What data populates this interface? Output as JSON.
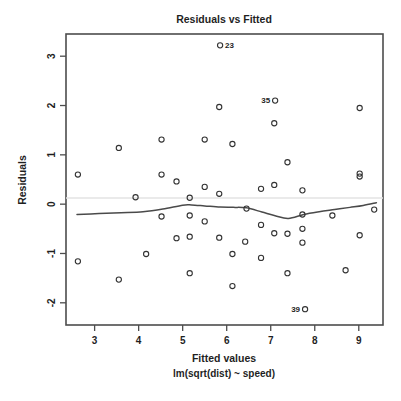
{
  "chart_data": {
    "type": "scatter",
    "title": "Residuals vs Fitted",
    "xlabel": "Fitted values",
    "sublabel": "lm(sqrt(dist) ~ speed)",
    "ylabel": "Residuals",
    "xlim": [
      2.35,
      9.55
    ],
    "ylim": [
      -2.45,
      3.45
    ],
    "xticks": [
      3,
      4,
      5,
      6,
      7,
      8,
      9
    ],
    "xticklabels": [
      "3",
      "4",
      "5",
      "6",
      "7",
      "8",
      "9"
    ],
    "yticks": [
      -2,
      -1,
      0,
      1,
      2,
      3
    ],
    "yticklabels": [
      "-2",
      "-1",
      "0",
      "1",
      "2",
      "3"
    ],
    "grid": false,
    "legend": null,
    "reference_line": {
      "y": 0,
      "color": "#e3e3e3"
    },
    "smoother": {
      "name": "lowess",
      "color": "#4a4a4a",
      "x": [
        2.6,
        3.1,
        3.6,
        4.1,
        4.55,
        5.0,
        5.2,
        5.5,
        5.85,
        6.15,
        6.45,
        6.8,
        7.1,
        7.4,
        7.75,
        8.1,
        8.45,
        8.8,
        9.1,
        9.4
      ],
      "y": [
        -0.21,
        -0.19,
        -0.175,
        -0.155,
        -0.1,
        -0.02,
        -0.015,
        -0.035,
        -0.06,
        -0.065,
        -0.075,
        -0.16,
        -0.235,
        -0.29,
        -0.21,
        -0.155,
        -0.11,
        -0.065,
        -0.025,
        0.03
      ]
    },
    "points": [
      {
        "x": 2.62,
        "y": 0.6
      },
      {
        "x": 2.62,
        "y": -1.16
      },
      {
        "x": 3.55,
        "y": 1.14
      },
      {
        "x": 3.55,
        "y": -1.53
      },
      {
        "x": 3.93,
        "y": 0.14
      },
      {
        "x": 4.17,
        "y": -1.01
      },
      {
        "x": 4.52,
        "y": 1.31
      },
      {
        "x": 4.52,
        "y": 0.6
      },
      {
        "x": 4.52,
        "y": -0.25
      },
      {
        "x": 4.86,
        "y": 0.46
      },
      {
        "x": 4.86,
        "y": -0.69
      },
      {
        "x": 5.16,
        "y": 0.13
      },
      {
        "x": 5.16,
        "y": -0.23
      },
      {
        "x": 5.16,
        "y": -0.66
      },
      {
        "x": 5.16,
        "y": -1.4
      },
      {
        "x": 5.5,
        "y": 1.31
      },
      {
        "x": 5.5,
        "y": 0.35
      },
      {
        "x": 5.5,
        "y": -0.35
      },
      {
        "x": 5.83,
        "y": 1.97
      },
      {
        "x": 5.83,
        "y": 0.21
      },
      {
        "x": 5.83,
        "y": -0.68
      },
      {
        "x": 5.85,
        "y": 3.22,
        "label": "23",
        "label_side": "right"
      },
      {
        "x": 6.13,
        "y": 1.22
      },
      {
        "x": 6.13,
        "y": -1.01
      },
      {
        "x": 6.13,
        "y": -1.66
      },
      {
        "x": 6.42,
        "y": -0.76
      },
      {
        "x": 6.45,
        "y": -0.09
      },
      {
        "x": 6.78,
        "y": 0.31
      },
      {
        "x": 6.78,
        "y": -0.42
      },
      {
        "x": 6.78,
        "y": -1.09
      },
      {
        "x": 7.08,
        "y": 1.64
      },
      {
        "x": 7.08,
        "y": 0.39
      },
      {
        "x": 7.08,
        "y": -0.59
      },
      {
        "x": 7.1,
        "y": 2.1,
        "label": "35",
        "label_side": "left"
      },
      {
        "x": 7.38,
        "y": 0.85
      },
      {
        "x": 7.38,
        "y": -0.6
      },
      {
        "x": 7.38,
        "y": -1.4
      },
      {
        "x": 7.72,
        "y": 0.28
      },
      {
        "x": 7.72,
        "y": -0.21
      },
      {
        "x": 7.72,
        "y": -0.5
      },
      {
        "x": 7.72,
        "y": -0.78
      },
      {
        "x": 7.78,
        "y": -2.13,
        "label": "39",
        "label_side": "left"
      },
      {
        "x": 8.4,
        "y": -0.23
      },
      {
        "x": 8.7,
        "y": -1.34
      },
      {
        "x": 9.02,
        "y": 1.95
      },
      {
        "x": 9.02,
        "y": 0.62
      },
      {
        "x": 9.02,
        "y": 0.56
      },
      {
        "x": 9.02,
        "y": -0.63
      },
      {
        "x": 9.35,
        "y": -0.11
      }
    ]
  },
  "figure": {
    "background": "#ffffff",
    "frame_color": "#4d4d4d",
    "point_color": "#333333",
    "label_color": "#1f1f1f"
  }
}
